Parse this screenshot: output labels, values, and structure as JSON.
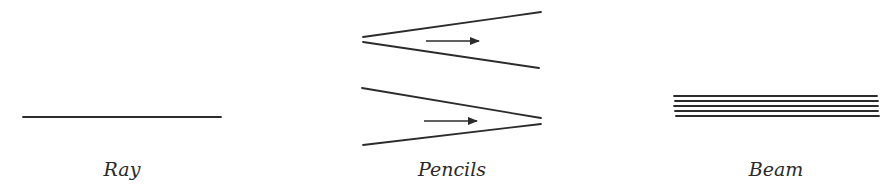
{
  "diagram": {
    "stroke_color": "#2b2b2b",
    "panels": [
      {
        "id": "ray",
        "caption": "Ray",
        "lines": [
          [
            23,
            117,
            221,
            117
          ]
        ],
        "arrows": []
      },
      {
        "id": "pencils",
        "caption": "Pencils",
        "lines": [
          [
            363,
            37,
            541,
            12
          ],
          [
            363,
            42,
            539,
            68
          ],
          [
            362,
            88,
            541,
            118
          ],
          [
            363,
            145,
            541,
            124
          ]
        ],
        "arrows": [
          [
            426,
            41,
            479,
            41
          ],
          [
            424,
            121,
            477,
            121
          ]
        ]
      },
      {
        "id": "beam",
        "caption": "Beam",
        "lines": [
          [
            674,
            96,
            877,
            96
          ],
          [
            675,
            101,
            878,
            101
          ],
          [
            674,
            106,
            878,
            106
          ],
          [
            675,
            111,
            878,
            111
          ],
          [
            676,
            116,
            879,
            116
          ]
        ],
        "arrows": []
      }
    ]
  }
}
